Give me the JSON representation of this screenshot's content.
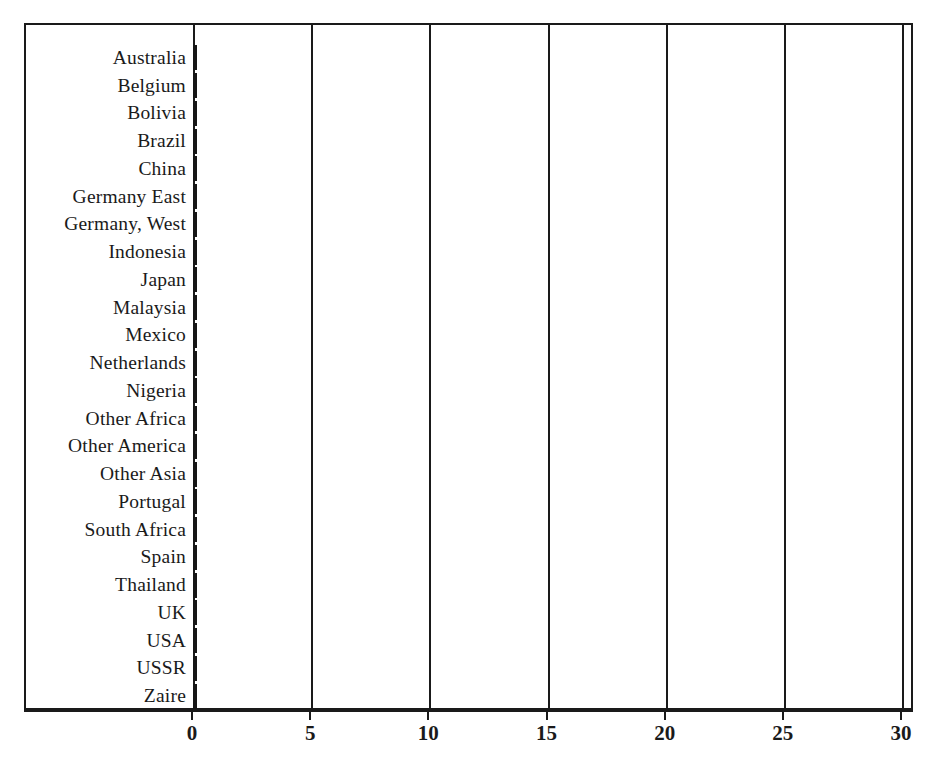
{
  "chart_data": {
    "type": "bar",
    "orientation": "horizontal",
    "title": "",
    "subtitle": "",
    "xlabel": "",
    "ylabel": "",
    "xlim": [
      0,
      30
    ],
    "ylim": null,
    "grid": "vertical gridlines at each major x tick",
    "legend": "none",
    "x_ticks": [
      0,
      5,
      10,
      15,
      20,
      25,
      30
    ],
    "x_tick_labels": [
      "0",
      "5",
      "10",
      "15",
      "20",
      "25",
      "30"
    ],
    "categories": [
      "Australia",
      "Belgium",
      "Bolivia",
      "Brazil",
      "China",
      "Germany  East",
      "Germany, West",
      "Indonesia",
      "Japan",
      "Malaysia",
      "Mexico",
      "Netherlands",
      "Nigeria",
      "Other Africa",
      "Other America",
      "Other Asia",
      "Portugal",
      "South Africa",
      "Spain",
      "Thailand",
      "UK",
      "USA",
      "USSR",
      "Zaire"
    ],
    "values": [
      5.3,
      3.2,
      15.9,
      8.3,
      19.7,
      1.3,
      4.6,
      25.4,
      0.9,
      18.6,
      0.15,
      1.6,
      2.9,
      0.45,
      0.12,
      1.9,
      0.3,
      1.5,
      4.6,
      28.6,
      10.3,
      5.7,
      17.4,
      1.0
    ],
    "bar_style": {
      "fill": "#e3e3e3",
      "pattern": "dotted-stipple",
      "edge": "#161616"
    }
  }
}
